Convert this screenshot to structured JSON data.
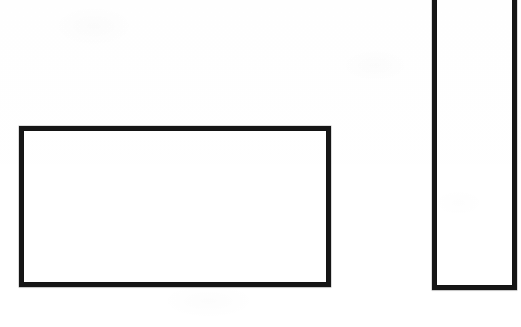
{
  "image": {
    "title": "Scanned page with two outlined rectangles",
    "width": 521,
    "height": 327,
    "background_color": "#ffffff",
    "ink_color": "#161616",
    "medium": "scanned white paper"
  },
  "shapes": [
    {
      "id": "rect-wide",
      "name": "wide-rectangle",
      "type": "rectangle",
      "label": "Wide landscape rectangle",
      "x": 19,
      "y": 126,
      "width": 312,
      "height": 161,
      "stroke_color": "#161616",
      "stroke_width": 5,
      "fill": "none",
      "clipped": "no"
    },
    {
      "id": "rect-tall",
      "name": "tall-rectangle",
      "type": "rectangle",
      "label": "Tall narrow rectangle",
      "x": 432,
      "y": -12,
      "width": 85,
      "height": 302,
      "stroke_color": "#161616",
      "stroke_width": 5,
      "fill": "none",
      "clipped": "top edge cropped by image boundary"
    }
  ],
  "text": {
    "has_text": false,
    "content": ""
  }
}
